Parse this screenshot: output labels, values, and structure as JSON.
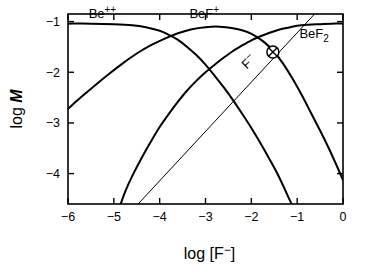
{
  "chart_data": {
    "type": "line",
    "title": "",
    "xlabel": "log [F⁻]",
    "ylabel": "log M",
    "ylabel_parts": {
      "prefix": "log ",
      "italic": "M"
    },
    "xlim": [
      -6,
      0
    ],
    "ylim": [
      -4.6,
      -0.85
    ],
    "grid": false,
    "legend_position": "inline-annotations",
    "xticks": [
      -6,
      -5,
      -4,
      -3,
      -2,
      -1,
      0
    ],
    "xtick_labels": [
      "−6",
      "−5",
      "−4",
      "−3",
      "−2",
      "−1",
      "0"
    ],
    "yticks": [
      -1,
      -2,
      -3,
      -4
    ],
    "ytick_labels": [
      "−1",
      "−2",
      "−3",
      "−4"
    ],
    "line_color": "#000000",
    "frame_color": "#000000",
    "series": [
      {
        "name": "Be⁺⁺",
        "label_text": "Be",
        "label_sup": "++",
        "label_x": -5.55,
        "label_y": -0.93,
        "stroke_width": 2.0,
        "points": [
          [
            -6.0,
            -1.04
          ],
          [
            -5.5,
            -1.04
          ],
          [
            -5.0,
            -1.05
          ],
          [
            -4.6,
            -1.07
          ],
          [
            -4.3,
            -1.11
          ],
          [
            -4.0,
            -1.18
          ],
          [
            -3.8,
            -1.26
          ],
          [
            -3.6,
            -1.36
          ],
          [
            -3.4,
            -1.5
          ],
          [
            -3.2,
            -1.66
          ],
          [
            -3.0,
            -1.85
          ],
          [
            -2.8,
            -2.07
          ],
          [
            -2.6,
            -2.3
          ],
          [
            -2.4,
            -2.55
          ],
          [
            -2.2,
            -2.82
          ],
          [
            -2.0,
            -3.1
          ],
          [
            -1.8,
            -3.4
          ],
          [
            -1.6,
            -3.72
          ],
          [
            -1.45,
            -3.97
          ],
          [
            -1.3,
            -4.25
          ],
          [
            -1.2,
            -4.45
          ],
          [
            -1.12,
            -4.6
          ]
        ]
      },
      {
        "name": "BeF⁺",
        "label_text": "BeF",
        "label_sup": "+",
        "label_x": -3.35,
        "label_y": -0.93,
        "stroke_width": 2.0,
        "points": [
          [
            -6.0,
            -2.72
          ],
          [
            -5.7,
            -2.48
          ],
          [
            -5.4,
            -2.25
          ],
          [
            -5.1,
            -2.03
          ],
          [
            -4.8,
            -1.82
          ],
          [
            -4.5,
            -1.63
          ],
          [
            -4.2,
            -1.47
          ],
          [
            -3.9,
            -1.34
          ],
          [
            -3.6,
            -1.23
          ],
          [
            -3.3,
            -1.15
          ],
          [
            -3.0,
            -1.11
          ],
          [
            -2.7,
            -1.1
          ],
          [
            -2.4,
            -1.13
          ],
          [
            -2.1,
            -1.2
          ],
          [
            -1.9,
            -1.29
          ],
          [
            -1.7,
            -1.42
          ],
          [
            -1.5,
            -1.6
          ],
          [
            -1.3,
            -1.84
          ],
          [
            -1.1,
            -2.13
          ],
          [
            -0.9,
            -2.45
          ],
          [
            -0.7,
            -2.8
          ],
          [
            -0.5,
            -3.15
          ],
          [
            -0.3,
            -3.52
          ],
          [
            -0.12,
            -3.88
          ],
          [
            0.0,
            -4.13
          ]
        ]
      },
      {
        "name": "BeF₂",
        "label_text": "BeF",
        "label_sub": "2",
        "label_x": -0.95,
        "label_y": -1.33,
        "stroke_width": 2.0,
        "points": [
          [
            -4.85,
            -4.6
          ],
          [
            -4.75,
            -4.35
          ],
          [
            -4.6,
            -4.05
          ],
          [
            -4.4,
            -3.7
          ],
          [
            -4.2,
            -3.38
          ],
          [
            -4.0,
            -3.08
          ],
          [
            -3.8,
            -2.82
          ],
          [
            -3.6,
            -2.58
          ],
          [
            -3.4,
            -2.36
          ],
          [
            -3.2,
            -2.17
          ],
          [
            -3.0,
            -2.0
          ],
          [
            -2.8,
            -1.85
          ],
          [
            -2.6,
            -1.71
          ],
          [
            -2.4,
            -1.58
          ],
          [
            -2.2,
            -1.47
          ],
          [
            -2.0,
            -1.37
          ],
          [
            -1.8,
            -1.29
          ],
          [
            -1.6,
            -1.22
          ],
          [
            -1.4,
            -1.16
          ],
          [
            -1.2,
            -1.12
          ],
          [
            -1.0,
            -1.08
          ],
          [
            -0.75,
            -1.06
          ],
          [
            -0.5,
            -1.05
          ],
          [
            -0.25,
            -1.04
          ],
          [
            0.0,
            -1.04
          ]
        ]
      },
      {
        "name": "F⁻",
        "label_text": "F",
        "label_sup": "−",
        "label_x": -2.1,
        "label_y": -1.95,
        "label_rotation": -44,
        "stroke_width": 1.0,
        "points": [
          [
            -4.47,
            -4.6
          ],
          [
            -0.62,
            -0.85
          ]
        ]
      }
    ],
    "markers": [
      {
        "name": "circled-x-marker",
        "x": -1.53,
        "y": -1.6,
        "shape": "circle-x",
        "radius": 6
      }
    ]
  }
}
